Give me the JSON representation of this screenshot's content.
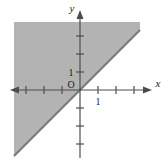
{
  "figure": {
    "kind": "coordinate-plane-inequality-graph",
    "background_color": "#ffffff",
    "width": 164,
    "height": 166
  },
  "axes": {
    "x_label": "x",
    "y_label": "y",
    "origin_label": "O",
    "axis_color": "#4d4d4d",
    "tick_color": "#4d4d4d",
    "x_tick_label": "1",
    "y_tick_label": "1",
    "unit_px": 18,
    "origin_px": {
      "x": 80,
      "y": 90
    },
    "x_range": [
      -4,
      4
    ],
    "y_range": [
      -4,
      4
    ],
    "x_axis_start_px": 14,
    "x_axis_end_px": 150,
    "y_axis_start_px": 8,
    "y_axis_end_px": 162
  },
  "boundary_line": {
    "label": "y = x",
    "slope": 1,
    "intercept": 0,
    "color": "#787878",
    "style": "solid",
    "width_px": 2
  },
  "shaded_region": {
    "description": "region above the line y = x",
    "inequality": "y >= x",
    "fill_color": "#b3b3b3",
    "opacity": 0.85,
    "bounds_px": {
      "left": 14,
      "top": 22,
      "right": 140,
      "bottom": 162
    }
  },
  "chart_data": {
    "type": "line",
    "title": "",
    "xlabel": "x",
    "ylabel": "y",
    "xlim": [
      -4,
      4
    ],
    "ylim": [
      -4,
      4
    ],
    "grid": false,
    "legend": null,
    "series": [
      {
        "name": "y = x",
        "type": "line",
        "x": [
          -4,
          4
        ],
        "values": [
          -4,
          4
        ],
        "color": "#787878",
        "linestyle": "solid"
      }
    ],
    "shaded_regions": [
      {
        "name": "y >= x",
        "above_series": "y = x",
        "color": "#b3b3b3"
      }
    ],
    "xticks": [
      -4,
      -3,
      -2,
      -1,
      1,
      2,
      3,
      4
    ],
    "yticks": [
      -4,
      -3,
      -2,
      -1,
      1,
      2,
      3,
      4
    ],
    "xticklabels": [
      "",
      "",
      "",
      "",
      "1",
      "",
      "",
      ""
    ],
    "yticklabels": [
      "",
      "",
      "",
      "",
      "1",
      "",
      "",
      ""
    ],
    "annotations": [
      {
        "text": "O",
        "x": 0,
        "y": 0,
        "role": "origin-label"
      },
      {
        "text": "x",
        "x": 4.2,
        "y": 0,
        "role": "x-axis-label"
      },
      {
        "text": "y",
        "x": 0,
        "y": 4.4,
        "role": "y-axis-label"
      }
    ]
  }
}
